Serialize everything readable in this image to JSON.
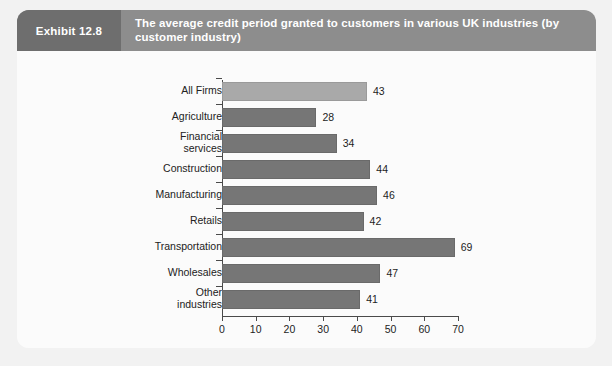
{
  "exhibit": {
    "tab_label": "Exhibit 12.8",
    "title": "The average credit period granted to customers in various UK industries (by customer industry)",
    "header_bg": "#8d8d8d",
    "tab_bg": "#6e6e6e",
    "title_color": "#ffffff",
    "card_bg": "#fbfbfb",
    "page_bg": "#f2f2f2"
  },
  "chart_data": {
    "type": "bar",
    "orientation": "horizontal",
    "title": "",
    "xlabel": "",
    "ylabel": "",
    "categories": [
      "All Firms",
      "Agriculture",
      "Financial\nservices",
      "Construction",
      "Manufacturing",
      "Retails",
      "Transportation",
      "Wholesales",
      "Other\nindustries"
    ],
    "values": [
      43,
      28,
      34,
      44,
      46,
      42,
      69,
      47,
      41
    ],
    "value_labels": [
      "43",
      "28",
      "34",
      "44",
      "46",
      "42",
      "69",
      "47",
      "41"
    ],
    "xlim": [
      0,
      70
    ],
    "xticks": [
      0,
      10,
      20,
      30,
      40,
      50,
      60,
      70
    ],
    "xtick_labels": [
      "0",
      "10",
      "20",
      "30",
      "40",
      "50",
      "60",
      "70"
    ],
    "grid": false,
    "legend": false,
    "bar_color": "#767676",
    "highlight_color": "#a9a9a9",
    "highlight_index": 0,
    "axis_color": "#4a4a4a",
    "plot_bg": "#fbfbfb"
  }
}
